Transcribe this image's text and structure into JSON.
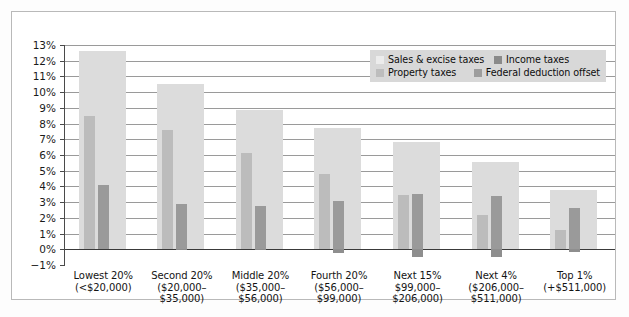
{
  "chart_data": {
    "type": "bar",
    "title": "",
    "subtitle": "",
    "xlabel": "",
    "ylabel": "",
    "ylim": [
      -1,
      13
    ],
    "ytick_labels": [
      "13%",
      "12%",
      "11%",
      "10%",
      "9%",
      "8%",
      "7%",
      "6%",
      "5%",
      "4%",
      "3%",
      "2%",
      "1%",
      "0%",
      "−1%"
    ],
    "ytick_values": [
      13,
      12,
      11,
      10,
      9,
      8,
      7,
      6,
      5,
      4,
      3,
      2,
      1,
      0,
      -1
    ],
    "grid": true,
    "legend_position": "top-right",
    "categories": [
      "Lowest 20%",
      "Second 20%",
      "Middle 20%",
      "Fourth 20%",
      "Next 15%",
      "Next 4%",
      "Top 1%"
    ],
    "category_sublabels": [
      [
        "(<$20,000)"
      ],
      [
        "($20,000–",
        "$35,000)"
      ],
      [
        "($35,000–",
        "$56,000)"
      ],
      [
        "($56,000–",
        "$99,000)"
      ],
      [
        "$99,000–",
        "$206,000)"
      ],
      [
        "($206,000–",
        "$511,000)"
      ],
      [
        "(+$511,000)"
      ]
    ],
    "series": [
      {
        "name": "Sales & excise taxes",
        "key": "sales",
        "color": "#dcdcdc",
        "values": [
          12.6,
          10.5,
          8.85,
          7.75,
          6.85,
          5.55,
          3.75
        ]
      },
      {
        "name": "Property taxes",
        "key": "prop",
        "color": "#bcbcbc",
        "values": [
          8.5,
          7.6,
          6.1,
          4.8,
          3.45,
          2.2,
          1.2
        ]
      },
      {
        "name": "Income taxes",
        "key": "inc",
        "color": "#9a9a9a",
        "values": [
          4.1,
          2.9,
          2.75,
          3.05,
          3.5,
          3.4,
          2.6
        ]
      },
      {
        "name": "Federal deduction offset",
        "key": "offset",
        "color": "#8e8e8e",
        "values": [
          0.0,
          -0.05,
          -0.05,
          -0.25,
          -0.5,
          -0.5,
          -0.2
        ]
      }
    ]
  },
  "legend": {
    "entries": [
      {
        "label": "Sales & excise taxes",
        "swatch": "sales"
      },
      {
        "label": "Income taxes",
        "swatch": "inc"
      },
      {
        "label": "Property taxes",
        "swatch": "prop"
      },
      {
        "label": "Federal deduction offset",
        "swatch": "off"
      }
    ]
  }
}
